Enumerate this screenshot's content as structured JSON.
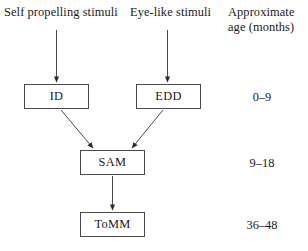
{
  "figure": {
    "type": "flowchart",
    "orientation": "top-to-bottom",
    "background_color": "#ffffff",
    "line_color": "#4a4a4a",
    "text_color": "#1a1a1a"
  },
  "columns": {
    "input_left": "Self propelling stimuli",
    "input_right": "Eye-like stimuli",
    "age_header_line1": "Approximate",
    "age_header_line2": "age (months)"
  },
  "nodes": [
    {
      "id": "ID",
      "label": "ID",
      "age": "0–9"
    },
    {
      "id": "EDD",
      "label": "EDD",
      "age": "0–9"
    },
    {
      "id": "SAM",
      "label": "SAM",
      "age": "9–18"
    },
    {
      "id": "ToMM",
      "label": "ToMM",
      "age": "36–48"
    }
  ],
  "node_map": {
    "id": {
      "label": "ID"
    },
    "edd": {
      "label": "EDD"
    },
    "sam": {
      "label": "SAM"
    },
    "tomm": {
      "label": "ToMM"
    }
  },
  "ages": {
    "row1": "0–9",
    "row2": "9–18",
    "row3": "36–48"
  },
  "edges": [
    {
      "from": "Self propelling stimuli",
      "to": "ID",
      "style": "straight-arrow"
    },
    {
      "from": "Eye-like stimuli",
      "to": "EDD",
      "style": "straight-arrow"
    },
    {
      "from": "ID",
      "to": "SAM",
      "style": "diagonal-arrow"
    },
    {
      "from": "EDD",
      "to": "SAM",
      "style": "diagonal-arrow"
    },
    {
      "from": "SAM",
      "to": "ToMM",
      "style": "straight-arrow"
    }
  ]
}
